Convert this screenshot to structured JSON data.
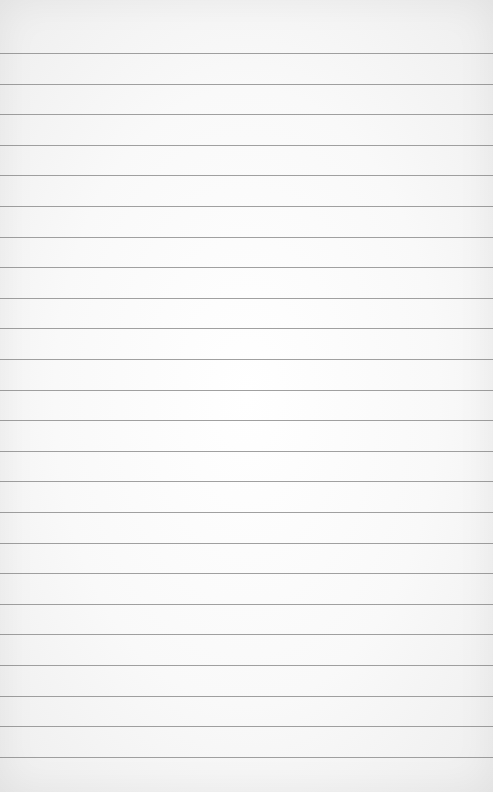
{
  "page": {
    "type": "lined-paper",
    "background_color": "#f9f9f9",
    "line_color": "#8f8f8f",
    "line_count": 24,
    "first_line_y": 53,
    "line_spacing": 30.6
  }
}
